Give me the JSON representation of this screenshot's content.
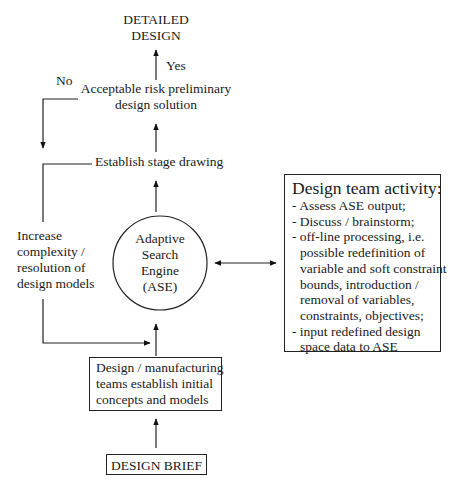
{
  "nodes": {
    "detailed_design": [
      "DETAILED",
      "DESIGN"
    ],
    "yes_label": "Yes",
    "no_label": "No",
    "acceptable_risk": [
      "Acceptable risk preliminary",
      "design solution"
    ],
    "establish_stage": "Establish stage drawing",
    "increase_complexity": [
      "Increase",
      "complexity /",
      "resolution of",
      "design models"
    ],
    "ase": [
      "Adaptive",
      "Search",
      "Engine",
      "(ASE)"
    ],
    "teams_establish": [
      "Design / manufacturing",
      "teams establish initial",
      "concepts and models"
    ],
    "design_brief": "DESIGN BRIEF"
  },
  "activity": {
    "title": "Design team activity:",
    "items": [
      [
        "- Assess ASE output;"
      ],
      [
        "- Discuss / brainstorm;"
      ],
      [
        "- off-line processing, i.e.",
        "possible redefinition of",
        "variable and soft constraint",
        "bounds, introduction /",
        "removal of variables,",
        "constraints, objectives;"
      ],
      [
        "- input redefined design",
        "space data to ASE"
      ]
    ]
  }
}
